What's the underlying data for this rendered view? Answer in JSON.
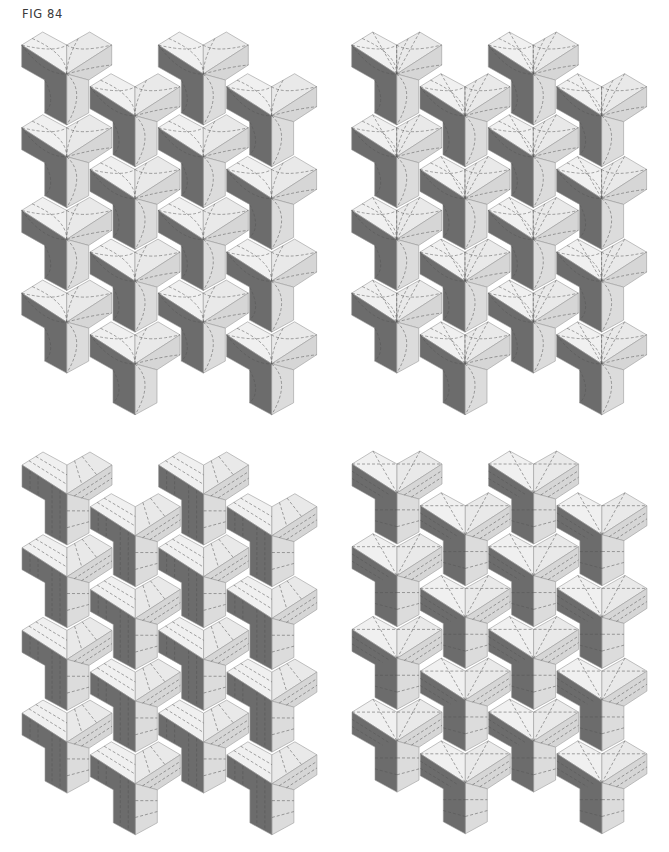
{
  "figure": {
    "label": "FIG 84"
  },
  "colors": {
    "light": "#f0f0f0",
    "light_right": "#e9e9e9",
    "medium": "#d6d6d6",
    "medium_stem": "#dcdcdc",
    "dark": "#6c6c6c",
    "outline": "#9a9a9a"
  },
  "unit_shape": {
    "description": "Y-shaped 3D block: two light roof faces, medium right arm + stem right face, dark left arm + stem left face",
    "points": {
      "left_vertex": [
        0,
        0
      ],
      "left_peak": [
        21,
        -13
      ],
      "valley": [
        45,
        0
      ],
      "right_peak": [
        68,
        -13
      ],
      "right_vertex": [
        90,
        0
      ],
      "center": [
        45,
        29
      ],
      "right_arm_bottom": [
        90,
        20
      ],
      "stem_right_top": [
        67,
        35
      ],
      "stem_right_bottom": [
        67,
        68
      ],
      "stem_bottom": [
        45,
        80
      ],
      "stem_left_bottom": [
        23,
        68
      ],
      "stem_left_top": [
        23,
        35
      ],
      "left_arm_bottom": [
        0,
        22
      ]
    }
  },
  "lattice": {
    "columns": 4,
    "rows": 4,
    "column_spacing": 68.3,
    "row_spacing": 82.7,
    "odd_column_offset_y": 41.7
  },
  "panels": [
    {
      "id": "top-left",
      "origin": [
        21.7,
        45
      ],
      "quilting": "arcs"
    },
    {
      "id": "top-right",
      "origin": [
        351.7,
        45
      ],
      "quilting": "arcs-lines"
    },
    {
      "id": "bottom-left",
      "origin": [
        22,
        465
      ],
      "quilting": "parallel-lines"
    },
    {
      "id": "bottom-right",
      "origin": [
        352,
        464
      ],
      "quilting": "crosses-lines"
    }
  ]
}
